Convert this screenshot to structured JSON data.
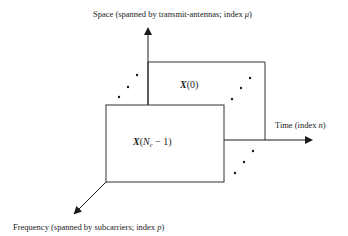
{
  "diagram": {
    "axes": {
      "space": {
        "label_prefix": "Space (spanned by transmit-antennas; index ",
        "index_symbol": "μ",
        "label_suffix": ")"
      },
      "time": {
        "label_prefix": "Time (index ",
        "index_symbol": "n",
        "label_suffix": ")"
      },
      "frequency": {
        "label_prefix": "Frequency (spanned by subcarriers; index ",
        "index_symbol": "p",
        "label_suffix": ")"
      }
    },
    "matrices": {
      "back": {
        "symbol": "X",
        "arg": "(0)"
      },
      "front": {
        "symbol": "X",
        "arg_open": "(",
        "arg_var": "N",
        "arg_sub": "c",
        "arg_rest": " − 1)"
      }
    },
    "ellipsis": "⋰"
  }
}
